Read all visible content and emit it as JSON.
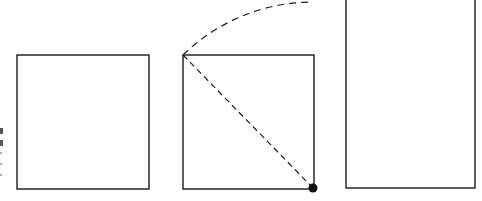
{
  "diagram": {
    "colors": {
      "stroke": "#1a1a1a",
      "background": "#ffffff"
    },
    "shapes": {
      "left_square": {
        "x": 17,
        "y": 55,
        "width": 132,
        "height": 134
      },
      "middle_square": {
        "x": 183,
        "y": 55,
        "width": 131,
        "height": 134
      },
      "diagonal": {
        "x1": 183,
        "y1": 55,
        "x2": 313,
        "y2": 188,
        "style": "dashed"
      },
      "arc": {
        "center_x": 313,
        "center_y": 188,
        "start_x": 183,
        "start_y": 55,
        "end_x": 313,
        "end_y": 2,
        "style": "dashed"
      },
      "pivot_dot": {
        "cx": 313,
        "cy": 188,
        "r": 4.5
      },
      "right_rectangle": {
        "x": 346,
        "y": -10,
        "width": 129,
        "height": 198
      }
    },
    "edge_marks": {
      "x": 2,
      "y_values": [
        128,
        140,
        152,
        163,
        174
      ]
    }
  }
}
